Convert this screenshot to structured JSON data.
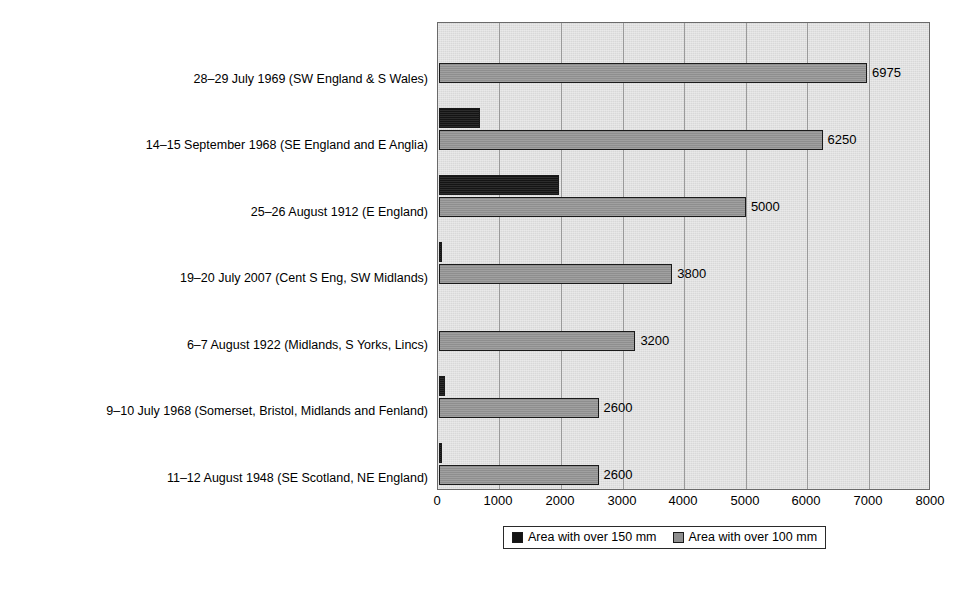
{
  "chart_data": {
    "type": "bar",
    "orientation": "horizontal",
    "title": "",
    "xlabel": "",
    "ylabel": "",
    "xlim": [
      0,
      8000
    ],
    "xticks": [
      "0",
      "1000",
      "2000",
      "3000",
      "4000",
      "5000",
      "6000",
      "7000",
      "8000"
    ],
    "grid": true,
    "legend_position": "bottom",
    "categories": [
      "28–29 July 1969 (SW England & S Wales)",
      "14–15 September 1968 (SE England and E Anglia)",
      "25–26 August 1912 (E England)",
      "19–20 July 2007 (Cent S Eng, SW Midlands)",
      "6–7 August 1922 (Midlands, S Yorks, Lincs)",
      "9–10 July 1968 (Somerset, Bristol, Midlands and Fenland)",
      "11–12 August 1948 (SE Scotland, NE England)"
    ],
    "series": [
      {
        "name": "Area with over 150 mm",
        "color": "#141414",
        "values": [
          0,
          660,
          1960,
          50,
          0,
          100,
          40
        ],
        "labels": [
          "",
          "",
          "",
          "",
          "",
          "",
          ""
        ]
      },
      {
        "name": "Area with over 100 mm",
        "color": "#8e8e8e",
        "values": [
          6975,
          6250,
          5000,
          3800,
          3200,
          2600,
          2600
        ],
        "labels": [
          "6975",
          "6250",
          "5000",
          "3800",
          "3200",
          "2600",
          "2600"
        ]
      }
    ]
  },
  "legend": {
    "items": [
      {
        "label": "Area with over 150 mm",
        "swatch": "black-swatch-icon"
      },
      {
        "label": "Area with over 100 mm",
        "swatch": "gray-swatch-icon"
      }
    ]
  }
}
